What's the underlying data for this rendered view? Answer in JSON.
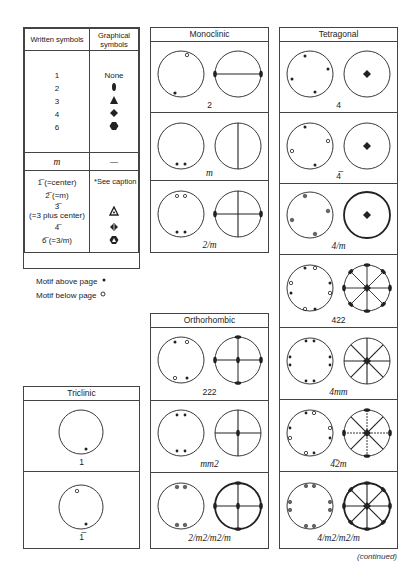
{
  "legend": {
    "header_written": "Written symbols",
    "header_graphical": "Graphical symbols",
    "rotation_rows": [
      {
        "written": "1",
        "graphical": "None",
        "icon": "none"
      },
      {
        "written": "2",
        "graphical": "",
        "icon": "lens-diad-icon"
      },
      {
        "written": "3",
        "graphical": "",
        "icon": "triangle-triad-icon"
      },
      {
        "written": "4",
        "graphical": "",
        "icon": "square-tetrad-icon"
      },
      {
        "written": "6",
        "graphical": "",
        "icon": "hexagon-hexad-icon"
      }
    ],
    "mirror_row": {
      "written": "m",
      "graphical": "—"
    },
    "inversion_rows": [
      {
        "written": "1̅ (=center)"
      },
      {
        "written": "2̅ (=m)"
      },
      {
        "written": "3̅"
      },
      {
        "written": "(=3 plus center)"
      },
      {
        "written": "4̅"
      },
      {
        "written": "6̅ (=3/m)"
      }
    ],
    "see_caption": "*See caption",
    "motif_above": "Motif above page",
    "motif_below": "Motif below page"
  },
  "systems": {
    "triclinic": {
      "title": "Triclinic",
      "groups": [
        "1",
        "1̅"
      ]
    },
    "monoclinic": {
      "title": "Monoclinic",
      "groups": [
        "2",
        "m",
        "2/m"
      ]
    },
    "orthorhombic": {
      "title": "Orthorhombic",
      "groups": [
        "222",
        "mm2",
        "2/m2/m2/m"
      ]
    },
    "tetragonal": {
      "title": "Tetragonal",
      "groups": [
        "4",
        "4̅",
        "4/m",
        "422",
        "4mm",
        "4̅2m",
        "4/m2/m2/m"
      ]
    }
  },
  "footer": {
    "continued": "(continued)"
  },
  "colors": {
    "line": "#444444",
    "ink": "#222222",
    "grey_dot": "#666666"
  }
}
